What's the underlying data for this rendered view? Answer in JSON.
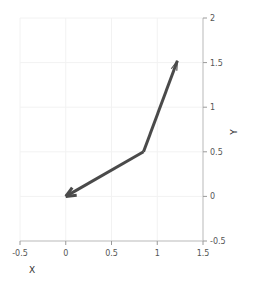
{
  "chart_data": {
    "type": "line",
    "title": "",
    "xlabel": "X",
    "ylabel": "Y",
    "xlim": [
      -0.5,
      1.5
    ],
    "ylim": [
      -0.5,
      2.0
    ],
    "xticks": [
      -0.5,
      0,
      0.5,
      1,
      1.5
    ],
    "xticklabels": [
      "-0.5",
      "0",
      "0.5",
      "1",
      "1.5"
    ],
    "yticks": [
      -0.5,
      0,
      0.5,
      1,
      1.5,
      2
    ],
    "yticklabels": [
      "-0.5",
      "0",
      "0.5",
      "1",
      "1.5",
      "2"
    ],
    "grid": true,
    "legend": null,
    "yaxis_position": "right",
    "xaxis_position": "bottom",
    "series": [
      {
        "name": "vector-1",
        "type": "arrow",
        "tail": [
          0.85,
          0.5
        ],
        "head": [
          0.0,
          0.0
        ],
        "color": "#4a4a4a",
        "linewidth": 3.0,
        "arrowhead": "thick"
      },
      {
        "name": "vector-2",
        "type": "arrow",
        "tail": [
          0.85,
          0.5
        ],
        "head": [
          1.22,
          1.52
        ],
        "color": "#4a4a4a",
        "linewidth": 3.0,
        "arrowhead": "thin"
      }
    ],
    "x": [
      0.0,
      0.85,
      1.22
    ],
    "y": [
      0.0,
      0.5,
      1.52
    ]
  },
  "style": {
    "line_color": "#4a4a4a",
    "grid_color": "#f2f2f2",
    "spine_color": "#bfbfbf",
    "tick_color": "#9a9a9a",
    "tick_label_color": "#555555",
    "axis_title_color": "#333333",
    "background": "#ffffff"
  }
}
